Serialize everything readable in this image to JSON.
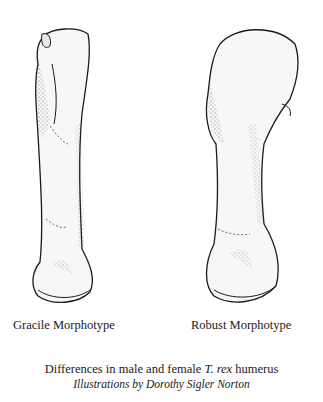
{
  "figure": {
    "left_label": "Gracile Morphotype",
    "right_label": "Robust Morphotype",
    "caption": {
      "prefix": "Differences in male and female ",
      "species": "T. rex",
      "suffix": " humerus"
    },
    "credit": "Illustrations by Dorothy Sigler Norton"
  },
  "colors": {
    "background": "#ffffff",
    "ink": "#1a1a1a",
    "bone_fill": "#f7f7f5",
    "shading": "#6e6e6e"
  }
}
